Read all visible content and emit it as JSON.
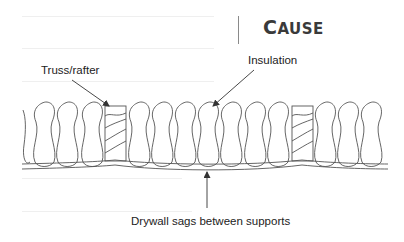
{
  "title": {
    "first_letter": "C",
    "rest": "AUSE"
  },
  "labels": {
    "truss": "Truss/rafter",
    "insulation": "Insulation",
    "drywall": "Drywall sags between supports"
  },
  "colors": {
    "line": "#555555",
    "text": "#222222",
    "title": "#3a3a3a",
    "faint_rule": "#efefef"
  }
}
